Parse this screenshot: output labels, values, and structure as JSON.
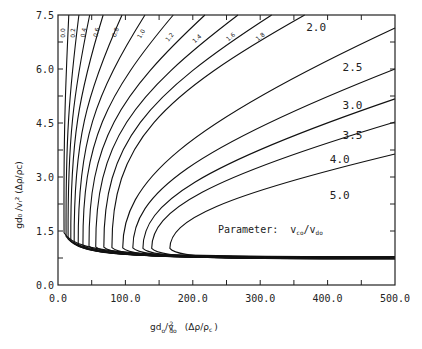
{
  "chart_data": {
    "type": "line",
    "title": "",
    "xlabel": "gd_o/v_do^2 (Δρ/ρ_c)",
    "ylabel": "gd_o/v_r^2 (Δρ/ρ_c)",
    "xlim": [
      0,
      500
    ],
    "ylim": [
      0,
      7.5
    ],
    "x_ticks": [
      0,
      100,
      200,
      300,
      400,
      500
    ],
    "x_tick_labels": [
      "0.0",
      "100.0",
      "200.0",
      "300.0",
      "400.0",
      "500.0"
    ],
    "x_minor_ticks": [
      50,
      150,
      250,
      350,
      450
    ],
    "y_ticks": [
      0,
      1.5,
      3.0,
      4.5,
      6.0,
      7.5
    ],
    "y_tick_labels": [
      "0.0",
      "1.5",
      "3.0",
      "4.5",
      "6.0",
      "7.5"
    ],
    "y_minor_ticks": [
      0.75,
      2.25,
      3.75,
      5.25,
      6.75
    ],
    "grid": false,
    "legend": "none (curves labeled inline)",
    "annotation": "Parameter: v_co/v_do",
    "lower_asymptote_y": 0.72,
    "series": [
      {
        "name": "0.0",
        "nose": [
          9,
          1.45
        ],
        "exit": {
          "edge": "top",
          "x": 16,
          "y": 7.5
        }
      },
      {
        "name": "0.2",
        "nose": [
          12,
          1.35
        ],
        "exit": {
          "edge": "top",
          "x": 31,
          "y": 7.5
        }
      },
      {
        "name": "0.4",
        "nose": [
          15,
          1.28
        ],
        "exit": {
          "edge": "top",
          "x": 47,
          "y": 7.5
        }
      },
      {
        "name": "0.6",
        "nose": [
          19,
          1.22
        ],
        "exit": {
          "edge": "top",
          "x": 67,
          "y": 7.5
        }
      },
      {
        "name": "0.8",
        "nose": [
          24,
          1.17
        ],
        "exit": {
          "edge": "top",
          "x": 95,
          "y": 7.5
        }
      },
      {
        "name": "1.0",
        "nose": [
          30,
          1.13
        ],
        "exit": {
          "edge": "top",
          "x": 129,
          "y": 7.5
        }
      },
      {
        "name": "1.2",
        "nose": [
          37,
          1.1
        ],
        "exit": {
          "edge": "top",
          "x": 171,
          "y": 7.5
        }
      },
      {
        "name": "1.4",
        "nose": [
          46,
          1.08
        ],
        "exit": {
          "edge": "top",
          "x": 218,
          "y": 7.5
        }
      },
      {
        "name": "1.6",
        "nose": [
          56,
          1.06
        ],
        "exit": {
          "edge": "top",
          "x": 267,
          "y": 7.5
        }
      },
      {
        "name": "1.8",
        "nose": [
          68,
          1.05
        ],
        "exit": {
          "edge": "top",
          "x": 317,
          "y": 7.5
        }
      },
      {
        "name": "2.0",
        "nose": [
          80,
          1.04
        ],
        "exit": {
          "edge": "top",
          "x": 366,
          "y": 7.5
        }
      },
      {
        "name": "2.5",
        "nose": [
          96,
          1.03
        ],
        "exit": {
          "edge": "right",
          "x": 500,
          "y": 7.14
        }
      },
      {
        "name": "3.0",
        "nose": [
          111,
          1.03
        ],
        "exit": {
          "edge": "right",
          "x": 500,
          "y": 6.0
        }
      },
      {
        "name": "3.5",
        "nose": [
          126,
          1.02
        ],
        "exit": {
          "edge": "right",
          "x": 500,
          "y": 5.17
        }
      },
      {
        "name": "4.0",
        "nose": [
          139,
          1.02
        ],
        "exit": {
          "edge": "right",
          "x": 500,
          "y": 4.53
        }
      },
      {
        "name": "5.0",
        "nose": [
          166,
          1.02
        ],
        "exit": {
          "edge": "right",
          "x": 500,
          "y": 3.64
        }
      }
    ],
    "inline_labels": [
      {
        "text": "0.0",
        "x": 11,
        "y": 7.0,
        "rotate": -90,
        "size": "small"
      },
      {
        "text": "0.2",
        "x": 25,
        "y": 7.0,
        "rotate": -90,
        "size": "small"
      },
      {
        "text": "0.4",
        "x": 41,
        "y": 7.0,
        "rotate": -80,
        "size": "small"
      },
      {
        "text": "0.6",
        "x": 60,
        "y": 7.0,
        "rotate": -75,
        "size": "small"
      },
      {
        "text": "0.8",
        "x": 88,
        "y": 7.0,
        "rotate": -70,
        "size": "small"
      },
      {
        "text": "1.0",
        "x": 126,
        "y": 6.95,
        "rotate": -60,
        "size": "small"
      },
      {
        "text": "1.2",
        "x": 168,
        "y": 6.85,
        "rotate": -50,
        "size": "small"
      },
      {
        "text": "1.4",
        "x": 208,
        "y": 6.8,
        "rotate": -42,
        "size": "small"
      },
      {
        "text": "1.6",
        "x": 258,
        "y": 6.85,
        "rotate": -40,
        "size": "small"
      },
      {
        "text": "1.8",
        "x": 302,
        "y": 6.85,
        "rotate": -38,
        "size": "small"
      },
      {
        "text": "2.0",
        "x": 383,
        "y": 7.05,
        "rotate": 0,
        "size": "large"
      },
      {
        "text": "2.5",
        "x": 437,
        "y": 5.95,
        "rotate": 0,
        "size": "large"
      },
      {
        "text": "3.0",
        "x": 437,
        "y": 4.9,
        "rotate": 0,
        "size": "large"
      },
      {
        "text": "3.5",
        "x": 437,
        "y": 4.05,
        "rotate": 0,
        "size": "large"
      },
      {
        "text": "4.0",
        "x": 418,
        "y": 3.4,
        "rotate": 0,
        "size": "large"
      },
      {
        "text": "5.0",
        "x": 418,
        "y": 2.4,
        "rotate": 0,
        "size": "large"
      }
    ],
    "line_color": "#111111"
  },
  "labels": {
    "x_axis_title_main": "gd",
    "x_axis_title_sub": "o",
    "x_axis_title_mid": "/v",
    "x_axis_title_sup": "2",
    "x_axis_title_sub2": "do",
    "x_axis_title_tail": "(Δρ/ρ",
    "x_axis_title_tail_sub": "c",
    "x_axis_title_close": ")",
    "y_axis_title": "gd₀ /vᵣ² (Δρ/ρc)",
    "parameter_prefix": "Parameter:",
    "parameter_v1": "v",
    "parameter_v1_sub": "co",
    "parameter_slash": "/v",
    "parameter_v2_sub": "do"
  }
}
